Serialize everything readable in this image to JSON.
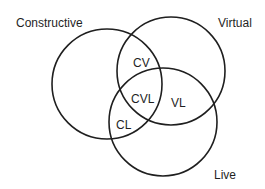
{
  "diagram": {
    "type": "venn",
    "sets": [
      {
        "id": "constructive",
        "label": "Constructive",
        "cx": 107,
        "cy": 84,
        "r": 55
      },
      {
        "id": "virtual",
        "label": "Virtual",
        "cx": 171,
        "cy": 71,
        "r": 54
      },
      {
        "id": "live",
        "label": "Live",
        "cx": 163,
        "cy": 122,
        "r": 54
      }
    ],
    "intersections": {
      "cv": "CV",
      "cvl": "CVL",
      "vl": "VL",
      "cl": "CL"
    },
    "stroke_color": "#1f1f1f",
    "background": "#ffffff"
  }
}
